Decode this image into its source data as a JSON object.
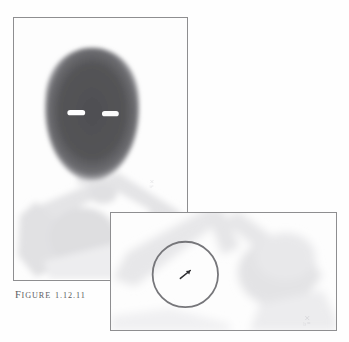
{
  "figure": {
    "caption_prefix_first": "F",
    "caption_prefix_rest": "IGURE",
    "caption_number": "1.12.11",
    "caption_full": "FIGURE 1.12.11",
    "page_background": "#ffffff",
    "panel_border_color": "#8e8e90"
  },
  "main_panel": {
    "name": "bone-scintigraphy-head-neck",
    "modality_appearance": "nuclear-medicine-grayscale-scan",
    "background": "#fdfdfd",
    "head": {
      "label": "skull-uptake-region",
      "fill_color": "#545457",
      "shape": "oval",
      "center_x_pct": 45,
      "center_y_pct": 38,
      "width_pct": 52,
      "height_pct": 50
    },
    "eye_markers": [
      {
        "label": "left-orbital-cold-spot",
        "color": "#ffffff",
        "x_pct": 36,
        "y_pct": 37
      },
      {
        "label": "right-orbital-cold-spot",
        "color": "#ffffff",
        "x_pct": 55,
        "y_pct": 37
      }
    ],
    "skeleton": {
      "label": "shoulder-girdle-faint-uptake",
      "fill_color": "#e3e3e5",
      "structures": [
        "cervical-spine",
        "clavicles",
        "scapulae",
        "humeri",
        "ribs"
      ]
    },
    "corner_mark": {
      "label": "faint-corner-artifact",
      "color": "#dedee0",
      "x_pct": 80,
      "y_pct": 63
    }
  },
  "inset_panel": {
    "name": "magnified-shoulder-detail",
    "background": "#fdfdfd",
    "skeleton_fill_color": "#e6e6e8",
    "roi_circle": {
      "label": "region-of-interest-circle",
      "stroke_color": "#76767a",
      "stroke_width": 1.6,
      "center_x_pct": 33,
      "center_y_pct": 52,
      "radius_pct": 21
    },
    "roi_marker": {
      "label": "focal-lesion-arrow-marker",
      "color": "#2e2e30",
      "x_pct": 33,
      "y_pct": 52
    },
    "corner_mark": {
      "label": "faint-corner-artifact",
      "color": "#d9d9dc",
      "x_pct": 88,
      "y_pct": 88
    }
  }
}
